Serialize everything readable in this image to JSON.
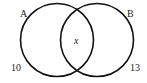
{
  "diagram": {
    "type": "venn",
    "sets": [
      {
        "label": "A",
        "only_value": "10"
      },
      {
        "label": "B",
        "only_value": "13"
      }
    ],
    "intersection": {
      "value": "x"
    },
    "colors": {
      "stroke": "#111111",
      "text": "#222222",
      "background": "#ffffff"
    }
  }
}
